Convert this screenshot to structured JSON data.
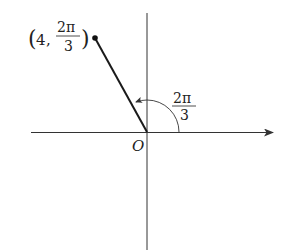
{
  "diagram": {
    "type": "polar-coordinate-plot",
    "origin_label": "O",
    "point": {
      "label_prefix": "(4,",
      "label_suffix": ")",
      "r": "4",
      "theta_numerator": "2π",
      "theta_denominator": "3"
    },
    "angle_label": {
      "numerator": "2π",
      "denominator": "3"
    },
    "colors": {
      "line": "#1a1a1a",
      "axis": "#333333",
      "text": "#222222"
    }
  }
}
